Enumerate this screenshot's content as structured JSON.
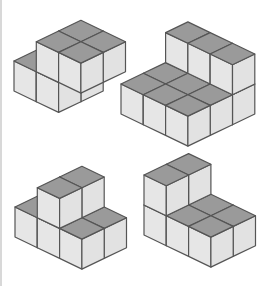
{
  "diagram": {
    "colors": {
      "top": "#9a9a9a",
      "left": "#e6e6e6",
      "right": "#e2e2e2",
      "edge": "#555555",
      "background": "#ffffff"
    },
    "projection": {
      "a": [
        22.3,
        10.7
      ],
      "b": [
        22.3,
        -10.7
      ],
      "h": 30
    },
    "figures": [
      {
        "name": "figure-top-left",
        "origin": [
          14,
          91
        ],
        "cubes": [
          [
            0,
            0,
            0
          ],
          [
            0,
            1,
            0
          ],
          [
            1,
            0,
            0
          ],
          [
            1,
            1,
            0
          ],
          [
            1,
            0,
            1
          ],
          [
            1,
            1,
            1
          ],
          [
            2,
            0,
            1
          ],
          [
            2,
            1,
            1
          ]
        ]
      },
      {
        "name": "figure-top-right",
        "origin": [
          121,
          114
        ],
        "cubes": [
          [
            0,
            0,
            0
          ],
          [
            0,
            1,
            0
          ],
          [
            1,
            0,
            0
          ],
          [
            1,
            1,
            0
          ],
          [
            2,
            0,
            0
          ],
          [
            2,
            1,
            0
          ],
          [
            0,
            2,
            0
          ],
          [
            1,
            2,
            0
          ],
          [
            2,
            2,
            0
          ],
          [
            0,
            2,
            1
          ],
          [
            1,
            2,
            1
          ],
          [
            2,
            2,
            1
          ]
        ]
      },
      {
        "name": "figure-bottom-left",
        "origin": [
          15,
          237
        ],
        "cubes": [
          [
            0,
            0,
            0
          ],
          [
            0,
            1,
            0
          ],
          [
            1,
            0,
            0
          ],
          [
            1,
            1,
            0
          ],
          [
            2,
            0,
            0
          ],
          [
            2,
            1,
            0
          ],
          [
            1,
            0,
            1
          ],
          [
            1,
            1,
            1
          ]
        ]
      },
      {
        "name": "figure-bottom-right",
        "origin": [
          144,
          235
        ],
        "cubes": [
          [
            0,
            0,
            0
          ],
          [
            0,
            1,
            0
          ],
          [
            0,
            0,
            1
          ],
          [
            0,
            1,
            1
          ],
          [
            1,
            0,
            0
          ],
          [
            1,
            1,
            0
          ],
          [
            2,
            0,
            0
          ],
          [
            2,
            1,
            0
          ]
        ]
      }
    ]
  }
}
